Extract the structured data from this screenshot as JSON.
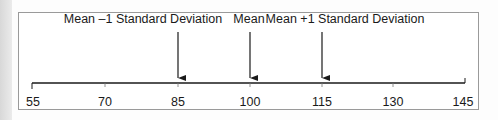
{
  "diagram": {
    "type": "number-line",
    "axis": {
      "min": 55,
      "max": 145,
      "ticks": [
        {
          "value": 55,
          "label": "55"
        },
        {
          "value": 70,
          "label": "70"
        },
        {
          "value": 85,
          "label": "85"
        },
        {
          "value": 100,
          "label": "100"
        },
        {
          "value": 115,
          "label": "115"
        },
        {
          "value": 130,
          "label": "130"
        },
        {
          "value": 145,
          "label": "145"
        }
      ]
    },
    "markers": [
      {
        "value": 85,
        "label": "Mean –1 Standard Deviation"
      },
      {
        "value": 100,
        "label": "Mean"
      },
      {
        "value": 115,
        "label": "Mean +1 Standard Deviation"
      }
    ],
    "colors": {
      "line": "#1a1a1a",
      "text": "#1a1a1a",
      "frame": "#9a9a9a"
    }
  }
}
